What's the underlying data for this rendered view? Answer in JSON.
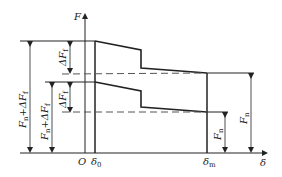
{
  "diagram": {
    "type": "force-displacement diagram",
    "axes": {
      "y_label": "F",
      "x_label": "δ",
      "origin_label": "O"
    },
    "x_markers": [
      {
        "base": "δ",
        "sub": "0"
      },
      {
        "base": "δ",
        "sub": "m"
      }
    ],
    "dimensions": {
      "outer_left": {
        "text": "F",
        "sub": "n",
        "suffix": "+ΔF",
        "suffix_sub": "f"
      },
      "inner_left": {
        "text": "F",
        "sub": "n",
        "suffix": "+ΔF",
        "suffix_sub": "f"
      },
      "upper_delta": {
        "text": "ΔF",
        "sub": "f"
      },
      "lower_delta": {
        "text": "ΔF",
        "sub": "f"
      },
      "right_inner": {
        "text": "F",
        "sub": "n"
      },
      "right_outer": {
        "text": "F",
        "sub": "n"
      }
    },
    "colors": {
      "line": "#222222",
      "dashed": "#555555",
      "background": "#ffffff"
    }
  }
}
